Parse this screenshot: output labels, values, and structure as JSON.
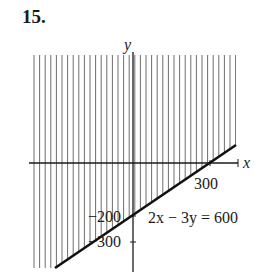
{
  "problem_number": "15.",
  "chart_data": {
    "type": "line",
    "title": "",
    "xlabel": "x",
    "ylabel": "y",
    "xlim": [
      -400,
      350
    ],
    "ylim": [
      -390,
      400
    ],
    "grid": false,
    "legend": null,
    "series": [
      {
        "name": "2x − 3y = 600",
        "x": [
          -315,
          0,
          300,
          390
        ],
        "y": [
          -410,
          -200,
          0,
          60
        ]
      }
    ],
    "shaded_region": {
      "inequality": "2x − 3y < 600",
      "side": "above line",
      "style": "vertical hatching"
    },
    "tick_labels": {
      "x": [
        {
          "value": 300,
          "label": "300"
        }
      ],
      "y": [
        {
          "value": -200,
          "label": "−200"
        },
        {
          "value": -300,
          "label": "−300"
        }
      ]
    },
    "annotations": [
      {
        "text": "2x − 3y = 600",
        "anchor": "right of line, below x-axis"
      }
    ]
  },
  "labels": {
    "x_axis": "x",
    "y_axis": "y",
    "x_tick_300": "300",
    "y_tick_neg200": "−200",
    "y_tick_neg300": "−300",
    "equation": "2x − 3y = 600"
  },
  "colors": {
    "ink": "#1a1a1a",
    "hatch": "#6e6e6e",
    "background": "#ffffff"
  }
}
